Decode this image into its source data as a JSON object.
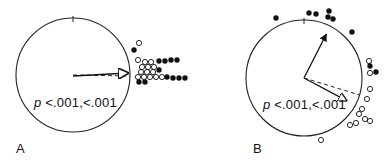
{
  "chart_data": [
    {
      "type": "scatter",
      "subtype": "circular",
      "panel": "A",
      "annotation": "p <.001, <.001",
      "center": [
        73,
        75
      ],
      "radius": 57,
      "mean_vector_solid": {
        "angle_deg": 2,
        "length": 0.97
      },
      "mean_vector_dashed": {
        "angle_deg": -1,
        "length": 1.0
      },
      "open_points": [
        [
          139,
          43
        ],
        [
          138,
          60
        ],
        [
          145,
          62
        ],
        [
          151,
          62
        ],
        [
          142,
          67
        ],
        [
          148,
          67
        ],
        [
          154,
          67
        ],
        [
          141,
          72
        ],
        [
          147,
          72
        ],
        [
          153,
          72
        ],
        [
          138,
          77
        ],
        [
          144,
          77
        ],
        [
          150,
          77
        ],
        [
          156,
          77
        ],
        [
          162,
          77
        ]
      ],
      "filled_points": [
        [
          134,
          50
        ],
        [
          159,
          61
        ],
        [
          165,
          61
        ],
        [
          171,
          60
        ],
        [
          177,
          60
        ],
        [
          159,
          70
        ],
        [
          167,
          77
        ],
        [
          173,
          78
        ],
        [
          179,
          78
        ],
        [
          185,
          78
        ],
        [
          139,
          82
        ],
        [
          145,
          82
        ]
      ]
    },
    {
      "type": "scatter",
      "subtype": "circular",
      "panel": "B",
      "annotation": "p <.001, <.001",
      "center": [
        304,
        78
      ],
      "radius": 58,
      "mean_vector_solid": {
        "angle_deg": 63,
        "length": 0.85
      },
      "mean_vector_dashed": {
        "angle_deg": -17,
        "length": 1.0
      },
      "open_points": [
        [
          369,
          61
        ],
        [
          370,
          73
        ],
        [
          370,
          89
        ],
        [
          367,
          99
        ],
        [
          362,
          109
        ],
        [
          359,
          114
        ],
        [
          365,
          119
        ],
        [
          370,
          121
        ],
        [
          350,
          125
        ],
        [
          356,
          123
        ],
        [
          321,
          140
        ]
      ],
      "filled_points": [
        [
          276,
          18
        ],
        [
          309,
          13
        ],
        [
          316,
          14
        ],
        [
          329,
          11
        ],
        [
          328,
          17
        ],
        [
          333,
          19
        ],
        [
          352,
          32
        ],
        [
          370,
          66
        ],
        [
          376,
          72
        ]
      ]
    }
  ],
  "panels": {
    "a": {
      "label": "A",
      "pvalue_prefix": "p",
      "pvalue_text": "<.001,<.001"
    },
    "b": {
      "label": "B",
      "pvalue_prefix": "p",
      "pvalue_text": "<.001,<.001"
    }
  }
}
